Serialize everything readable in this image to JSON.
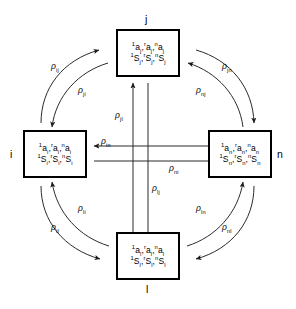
{
  "figure": {
    "type": "state-transfer-diagram",
    "stroke_color": "#000000",
    "background": "#ffffff"
  },
  "nodes": [
    {
      "id": "j",
      "label": "j",
      "row1": {
        "terms": [
          {
            "sup": "1",
            "base": "a",
            "sub": "j"
          },
          {
            "sup": "r",
            "base": "a",
            "sub": "j"
          },
          {
            "sup": "n",
            "base": "a",
            "sub": "j"
          }
        ]
      },
      "row2": {
        "terms": [
          {
            "sup": "1",
            "base": "S",
            "sub": "j"
          },
          {
            "sup": "r",
            "base": "S",
            "sub": "j"
          },
          {
            "sup": "n",
            "base": "S",
            "sub": "j"
          }
        ]
      }
    },
    {
      "id": "i",
      "label": "i",
      "row1": {
        "terms": [
          {
            "sup": "1",
            "base": "a",
            "sub": "i"
          },
          {
            "sup": "r",
            "base": "a",
            "sub": "i"
          },
          {
            "sup": "n",
            "base": "a",
            "sub": "i"
          }
        ]
      },
      "row2": {
        "terms": [
          {
            "sup": "1",
            "base": "S",
            "sub": "i"
          },
          {
            "sup": "r",
            "base": "S",
            "sub": "i"
          },
          {
            "sup": "n",
            "base": "S",
            "sub": "i"
          }
        ]
      }
    },
    {
      "id": "n",
      "label": "n",
      "row1": {
        "terms": [
          {
            "sup": "1",
            "base": "a",
            "sub": "n"
          },
          {
            "sup": "r",
            "base": "a",
            "sub": "n"
          },
          {
            "sup": "n",
            "base": "a",
            "sub": "n"
          }
        ]
      },
      "row2": {
        "terms": [
          {
            "sup": "1",
            "base": "S",
            "sub": "n"
          },
          {
            "sup": "r",
            "base": "S",
            "sub": "n"
          },
          {
            "sup": "n",
            "base": "S",
            "sub": "n"
          }
        ]
      }
    },
    {
      "id": "l",
      "label": "l",
      "row1": {
        "terms": [
          {
            "sup": "1",
            "base": "a",
            "sub": "l"
          },
          {
            "sup": "r",
            "base": "a",
            "sub": "l"
          },
          {
            "sup": "n",
            "base": "a",
            "sub": "l"
          }
        ]
      },
      "row2": {
        "terms": [
          {
            "sup": "1",
            "base": "S",
            "sub": "l"
          },
          {
            "sup": "r",
            "base": "S",
            "sub": "l"
          },
          {
            "sup": "n",
            "base": "S",
            "sub": "l"
          }
        ]
      }
    }
  ],
  "edges": [
    {
      "id": "ij",
      "symbol": "ρ",
      "sub": "ij",
      "from": "i",
      "to": "j",
      "path": "arc-upper-left-outer"
    },
    {
      "id": "ji",
      "symbol": "ρ",
      "sub": "ji",
      "from": "j",
      "to": "i",
      "path": "arc-upper-left-inner"
    },
    {
      "id": "jn",
      "symbol": "ρ",
      "sub": "jn",
      "from": "j",
      "to": "n",
      "path": "arc-upper-right-outer"
    },
    {
      "id": "nj",
      "symbol": "ρ",
      "sub": "nj",
      "from": "n",
      "to": "j",
      "path": "arc-upper-right-inner"
    },
    {
      "id": "il",
      "symbol": "ρ",
      "sub": "il",
      "from": "i",
      "to": "l",
      "path": "arc-lower-left-outer"
    },
    {
      "id": "li",
      "symbol": "ρ",
      "sub": "li",
      "from": "l",
      "to": "i",
      "path": "arc-lower-left-inner"
    },
    {
      "id": "ln",
      "symbol": "ρ",
      "sub": "ln",
      "from": "l",
      "to": "n",
      "path": "arc-lower-right-inner"
    },
    {
      "id": "nl",
      "symbol": "ρ",
      "sub": "nl",
      "from": "n",
      "to": "l",
      "path": "arc-lower-right-outer"
    },
    {
      "id": "jl",
      "symbol": "ρ",
      "sub": "jl",
      "from": "l",
      "to": "j",
      "path": "cross-vertical-up"
    },
    {
      "id": "lj",
      "symbol": "ρ",
      "sub": "lj",
      "from": "j",
      "to": "l",
      "path": "cross-vertical-down"
    },
    {
      "id": "in",
      "symbol": "ρ",
      "sub": "in",
      "from": "n",
      "to": "i",
      "path": "cross-horizontal-left"
    },
    {
      "id": "ni",
      "symbol": "ρ",
      "sub": "ni",
      "from": "i",
      "to": "n",
      "path": "cross-horizontal-right"
    }
  ]
}
